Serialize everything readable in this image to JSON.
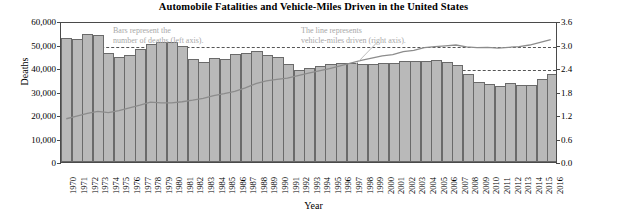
{
  "chart_data": {
    "type": "bar",
    "title": "Automobile Fatalities and Vehicle-Miles Driven in the United States",
    "xlabel": "Year",
    "ylabel": "Deaths",
    "ylabel_secondary": "Vehicle-miles (trillions)",
    "grid": true,
    "legend_position": "none",
    "ylim": [
      0,
      60000
    ],
    "ylim_secondary": [
      0.0,
      3.6
    ],
    "yticks": [
      "0",
      "10,000",
      "20,000",
      "30,000",
      "40,000",
      "50,000",
      "60,000"
    ],
    "ytick_values": [
      0,
      10000,
      20000,
      30000,
      40000,
      50000,
      60000
    ],
    "yticks_secondary": [
      "0.0",
      "0.6",
      "1.2",
      "1.8",
      "2.4",
      "3.0",
      "3.6"
    ],
    "ytick_values_secondary": [
      0.0,
      0.6,
      1.2,
      1.8,
      2.4,
      3.0,
      3.6
    ],
    "categories": [
      "1970",
      "1971",
      "1972",
      "1973",
      "1974",
      "1975",
      "1976",
      "1977",
      "1978",
      "1979",
      "1980",
      "1981",
      "1982",
      "1983",
      "1984",
      "1985",
      "1986",
      "1987",
      "1988",
      "1989",
      "1990",
      "1991",
      "1992",
      "1993",
      "1994",
      "1995",
      "1996",
      "1997",
      "1998",
      "1999",
      "2000",
      "2001",
      "2002",
      "2003",
      "2004",
      "2005",
      "2006",
      "2007",
      "2008",
      "2009",
      "2010",
      "2011",
      "2012",
      "2013",
      "2014",
      "2015",
      "2016"
    ],
    "series": [
      {
        "name": "Bars represent the number of deaths (left axis).",
        "axis": "left",
        "type": "bar",
        "color": "#b9b9b9",
        "edge_color": "#6a6a6a",
        "values": [
          52600,
          52500,
          54600,
          54100,
          46400,
          44500,
          45500,
          47900,
          50300,
          51100,
          51100,
          49300,
          43900,
          42600,
          44300,
          43800,
          46100,
          46400,
          47100,
          45600,
          44600,
          41500,
          39250,
          40150,
          40720,
          41820,
          42065,
          42013,
          41501,
          41717,
          41945,
          42196,
          43005,
          42884,
          42836,
          43510,
          42708,
          41259,
          37423,
          33883,
          32999,
          32479,
          33782,
          32893,
          32744,
          35485,
          37461
        ]
      },
      {
        "name": "The line represents vehicle-miles driven (right axis).",
        "axis": "right",
        "type": "line",
        "color": "#8c8c8c",
        "values": [
          1.12,
          1.19,
          1.26,
          1.31,
          1.28,
          1.33,
          1.4,
          1.47,
          1.55,
          1.53,
          1.53,
          1.56,
          1.6,
          1.65,
          1.72,
          1.77,
          1.83,
          1.92,
          2.03,
          2.1,
          2.14,
          2.17,
          2.24,
          2.3,
          2.36,
          2.42,
          2.49,
          2.56,
          2.63,
          2.69,
          2.75,
          2.78,
          2.86,
          2.89,
          2.96,
          2.99,
          3.01,
          3.03,
          2.98,
          2.96,
          2.97,
          2.95,
          2.97,
          2.99,
          3.03,
          3.1,
          3.17
        ]
      }
    ],
    "annotations": [
      {
        "id": "bars-note",
        "text": "Bars represent the\nnumber of deaths (left axis)."
      },
      {
        "id": "line-note",
        "text": "The line represents\nvehicle-miles driven (right axis)."
      }
    ]
  }
}
